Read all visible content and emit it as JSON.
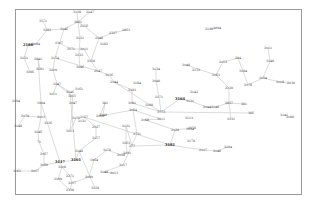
{
  "diagram": {
    "type": "network-graph",
    "frame": {
      "x": 15.5,
      "y": 9.5,
      "width": 286,
      "height": 185
    },
    "colors": {
      "frame": "#9a9a9a",
      "edge": "#c4c4c4",
      "label": "#333333"
    },
    "nodes": [
      {
        "id": "n1",
        "label": "3138",
        "x": 77,
        "y": 12
      },
      {
        "id": "n2",
        "label": "2147",
        "x": 90,
        "y": 12
      },
      {
        "id": "n3",
        "label": "3571",
        "x": 43,
        "y": 21
      },
      {
        "id": "n4",
        "label": "3821",
        "x": 78,
        "y": 22
      },
      {
        "id": "n5",
        "label": "2156",
        "x": 84,
        "y": 26
      },
      {
        "id": "n6",
        "label": "3182",
        "x": 47,
        "y": 30
      },
      {
        "id": "n7",
        "label": "3146",
        "x": 64,
        "y": 29
      },
      {
        "id": "n8",
        "label": "2327",
        "x": 113,
        "y": 33
      },
      {
        "id": "n9",
        "label": "1963",
        "x": 126,
        "y": 30
      },
      {
        "id": "n10",
        "label": "2131",
        "x": 80,
        "y": 38
      },
      {
        "id": "n11",
        "label": "2148",
        "x": 99,
        "y": 38
      },
      {
        "id": "n12",
        "label": "3182",
        "x": 104,
        "y": 44
      },
      {
        "id": "n13",
        "label": "2188",
        "x": 28,
        "y": 45,
        "bold": true
      },
      {
        "id": "n14",
        "label": "3084",
        "x": 36,
        "y": 44
      },
      {
        "id": "n15",
        "label": "2307",
        "x": 59,
        "y": 43
      },
      {
        "id": "n16",
        "label": "2571",
        "x": 71,
        "y": 49
      },
      {
        "id": "n17",
        "label": "3011",
        "x": 84,
        "y": 49
      },
      {
        "id": "n18",
        "label": "2133",
        "x": 79,
        "y": 55
      },
      {
        "id": "n19",
        "label": "2131",
        "x": 24,
        "y": 58
      },
      {
        "id": "n20",
        "label": "2841",
        "x": 38,
        "y": 59
      },
      {
        "id": "n21",
        "label": "2174",
        "x": 55,
        "y": 58
      },
      {
        "id": "n22",
        "label": "2138",
        "x": 91,
        "y": 61
      },
      {
        "id": "n23",
        "label": "3186",
        "x": 30,
        "y": 72
      },
      {
        "id": "n24",
        "label": "3181",
        "x": 40,
        "y": 69
      },
      {
        "id": "n25",
        "label": "2209",
        "x": 53,
        "y": 70
      },
      {
        "id": "n26",
        "label": "3046",
        "x": 80,
        "y": 67
      },
      {
        "id": "n27",
        "label": "2147",
        "x": 98,
        "y": 71
      },
      {
        "id": "n28",
        "label": "3136",
        "x": 109,
        "y": 75
      },
      {
        "id": "n29",
        "label": "2144",
        "x": 114,
        "y": 82
      },
      {
        "id": "n30",
        "label": "3184",
        "x": 137,
        "y": 83
      },
      {
        "id": "n31",
        "label": "3147",
        "x": 57,
        "y": 84
      },
      {
        "id": "n32",
        "label": "3011",
        "x": 53,
        "y": 94
      },
      {
        "id": "n33",
        "label": "3146",
        "x": 70,
        "y": 92
      },
      {
        "id": "n34",
        "label": "3165",
        "x": 72,
        "y": 96
      },
      {
        "id": "n35",
        "label": "2161",
        "x": 79,
        "y": 89
      },
      {
        "id": "n36",
        "label": "3183",
        "x": 132,
        "y": 90
      },
      {
        "id": "n37",
        "label": "2184",
        "x": 16,
        "y": 101
      },
      {
        "id": "n38",
        "label": "1994",
        "x": 41,
        "y": 103
      },
      {
        "id": "n39",
        "label": "2047",
        "x": 73,
        "y": 103
      },
      {
        "id": "n40",
        "label": "381",
        "x": 105,
        "y": 103
      },
      {
        "id": "n41",
        "label": "3081",
        "x": 132,
        "y": 103
      },
      {
        "id": "n42",
        "label": "3188",
        "x": 149,
        "y": 105
      },
      {
        "id": "n43",
        "label": "3773",
        "x": 161,
        "y": 112
      },
      {
        "id": "n44",
        "label": "3134",
        "x": 156,
        "y": 69
      },
      {
        "id": "n45",
        "label": "3048",
        "x": 156,
        "y": 81
      },
      {
        "id": "n46",
        "label": "2171",
        "x": 159,
        "y": 97
      },
      {
        "id": "n47",
        "label": "3164",
        "x": 180,
        "y": 99,
        "bold": true
      },
      {
        "id": "n48",
        "label": "3131",
        "x": 190,
        "y": 101
      },
      {
        "id": "n49",
        "label": "2143",
        "x": 194,
        "y": 92
      },
      {
        "id": "n50",
        "label": "2078",
        "x": 25,
        "y": 116
      },
      {
        "id": "n51",
        "label": "3148",
        "x": 18,
        "y": 126
      },
      {
        "id": "n52",
        "label": "2103",
        "x": 41,
        "y": 117
      },
      {
        "id": "n53",
        "label": "3126",
        "x": 48,
        "y": 123
      },
      {
        "id": "n54",
        "label": "3158",
        "x": 76,
        "y": 118
      },
      {
        "id": "n55",
        "label": "2157",
        "x": 84,
        "y": 117
      },
      {
        "id": "n56",
        "label": "2131",
        "x": 82,
        "y": 121
      },
      {
        "id": "n57",
        "label": "2008",
        "x": 100,
        "y": 116
      },
      {
        "id": "n58",
        "label": "2148",
        "x": 103,
        "y": 115
      },
      {
        "id": "n59",
        "label": "3064",
        "x": 133,
        "y": 110
      },
      {
        "id": "n60",
        "label": "3146",
        "x": 38,
        "y": 132
      },
      {
        "id": "n61",
        "label": "3113",
        "x": 70,
        "y": 131
      },
      {
        "id": "n62",
        "label": "2027",
        "x": 96,
        "y": 127
      },
      {
        "id": "n63",
        "label": "3157",
        "x": 96,
        "y": 138
      },
      {
        "id": "n64",
        "label": "2131",
        "x": 126,
        "y": 126
      },
      {
        "id": "n65",
        "label": "3731",
        "x": 137,
        "y": 134
      },
      {
        "id": "n66",
        "label": "2068",
        "x": 145,
        "y": 120
      },
      {
        "id": "n67",
        "label": "3111",
        "x": 161,
        "y": 119
      },
      {
        "id": "n68",
        "label": "3113",
        "x": 189,
        "y": 118
      },
      {
        "id": "n69",
        "label": "2158",
        "x": 192,
        "y": 128
      },
      {
        "id": "n70",
        "label": "2028",
        "x": 175,
        "y": 130
      },
      {
        "id": "n71",
        "label": "3134",
        "x": 190,
        "y": 129
      },
      {
        "id": "n72",
        "label": "71",
        "x": 39,
        "y": 142
      },
      {
        "id": "n73",
        "label": "3163",
        "x": 126,
        "y": 143
      },
      {
        "id": "n74",
        "label": "277",
        "x": 132,
        "y": 146
      },
      {
        "id": "n75",
        "label": "3181",
        "x": 170,
        "y": 145,
        "bold": true
      },
      {
        "id": "n76",
        "label": "2178",
        "x": 191,
        "y": 141
      },
      {
        "id": "n77",
        "label": "2067",
        "x": 44,
        "y": 154
      },
      {
        "id": "n78",
        "label": "2148",
        "x": 79,
        "y": 151
      },
      {
        "id": "n79",
        "label": "3178",
        "x": 107,
        "y": 150
      },
      {
        "id": "n80",
        "label": "2058",
        "x": 121,
        "y": 155
      },
      {
        "id": "n81",
        "label": "3191",
        "x": 127,
        "y": 153
      },
      {
        "id": "n82",
        "label": "2107",
        "x": 203,
        "y": 150
      },
      {
        "id": "n83",
        "label": "2048",
        "x": 217,
        "y": 151
      },
      {
        "id": "n84",
        "label": "3184",
        "x": 228,
        "y": 147
      },
      {
        "id": "n85",
        "label": "3117",
        "x": 60,
        "y": 162,
        "bold": true
      },
      {
        "id": "n86",
        "label": "3101",
        "x": 76,
        "y": 160,
        "bold": true
      },
      {
        "id": "n87",
        "label": "1964",
        "x": 94,
        "y": 160
      },
      {
        "id": "n88",
        "label": "3117",
        "x": 123,
        "y": 165
      },
      {
        "id": "n89",
        "label": "3061",
        "x": 17,
        "y": 171
      },
      {
        "id": "n90",
        "label": "2007",
        "x": 35,
        "y": 171
      },
      {
        "id": "n91",
        "label": "3069",
        "x": 44,
        "y": 165
      },
      {
        "id": "n92",
        "label": "3108",
        "x": 62,
        "y": 167
      },
      {
        "id": "n93",
        "label": "3148",
        "x": 104,
        "y": 172
      },
      {
        "id": "n94",
        "label": "2013",
        "x": 114,
        "y": 173
      },
      {
        "id": "n95",
        "label": "2199",
        "x": 58,
        "y": 179
      },
      {
        "id": "n96",
        "label": "2271",
        "x": 70,
        "y": 176
      },
      {
        "id": "n97",
        "label": "3157",
        "x": 72,
        "y": 183
      },
      {
        "id": "n98",
        "label": "2089",
        "x": 89,
        "y": 177
      },
      {
        "id": "n99",
        "label": "2338",
        "x": 70,
        "y": 190
      },
      {
        "id": "n100",
        "label": "3128",
        "x": 95,
        "y": 188
      },
      {
        "id": "n101",
        "label": "2138",
        "x": 209,
        "y": 29
      },
      {
        "id": "n102",
        "label": "3094",
        "x": 217,
        "y": 28
      },
      {
        "id": "n103",
        "label": "3011",
        "x": 268,
        "y": 48
      },
      {
        "id": "n104",
        "label": "3148",
        "x": 270,
        "y": 61
      },
      {
        "id": "n105",
        "label": "2053",
        "x": 223,
        "y": 62
      },
      {
        "id": "n106",
        "label": "384",
        "x": 238,
        "y": 58
      },
      {
        "id": "n107",
        "label": "3048",
        "x": 186,
        "y": 65
      },
      {
        "id": "n108",
        "label": "2133",
        "x": 196,
        "y": 70
      },
      {
        "id": "n109",
        "label": "2063",
        "x": 216,
        "y": 75
      },
      {
        "id": "n110",
        "label": "3184",
        "x": 243,
        "y": 71
      },
      {
        "id": "n111",
        "label": "3034",
        "x": 263,
        "y": 78
      },
      {
        "id": "n112",
        "label": "3008",
        "x": 280,
        "y": 82
      },
      {
        "id": "n113",
        "label": "2138",
        "x": 291,
        "y": 83
      },
      {
        "id": "n114",
        "label": "2078",
        "x": 248,
        "y": 85
      },
      {
        "id": "n115",
        "label": "2139",
        "x": 229,
        "y": 88
      },
      {
        "id": "n116",
        "label": "2837",
        "x": 229,
        "y": 103
      },
      {
        "id": "n117",
        "label": "381",
        "x": 244,
        "y": 104
      },
      {
        "id": "n118",
        "label": "2044",
        "x": 207,
        "y": 107
      },
      {
        "id": "n119",
        "label": "2148",
        "x": 215,
        "y": 107
      },
      {
        "id": "n120",
        "label": "2131",
        "x": 231,
        "y": 119
      },
      {
        "id": "n121",
        "label": "386",
        "x": 251,
        "y": 113
      },
      {
        "id": "n122",
        "label": "3141",
        "x": 284,
        "y": 115
      },
      {
        "id": "n123",
        "label": "2088",
        "x": 290,
        "y": 117
      }
    ],
    "edges": [
      [
        "n1",
        "n4"
      ],
      [
        "n2",
        "n4"
      ],
      [
        "n4",
        "n10"
      ],
      [
        "n4",
        "n5"
      ],
      [
        "n5",
        "n11"
      ],
      [
        "n7",
        "n4"
      ],
      [
        "n6",
        "n7"
      ],
      [
        "n6",
        "n3"
      ],
      [
        "n6",
        "n14"
      ],
      [
        "n14",
        "n13"
      ],
      [
        "n13",
        "n19"
      ],
      [
        "n19",
        "n23"
      ],
      [
        "n7",
        "n21"
      ],
      [
        "n21",
        "n25"
      ],
      [
        "n25",
        "n31"
      ],
      [
        "n10",
        "n18"
      ],
      [
        "n18",
        "n26"
      ],
      [
        "n11",
        "n22"
      ],
      [
        "n11",
        "n8"
      ],
      [
        "n8",
        "n9"
      ],
      [
        "n15",
        "n16"
      ],
      [
        "n16",
        "n17"
      ],
      [
        "n17",
        "n22"
      ],
      [
        "n22",
        "n27"
      ],
      [
        "n21",
        "n27"
      ],
      [
        "n27",
        "n28"
      ],
      [
        "n28",
        "n29"
      ],
      [
        "n29",
        "n36"
      ],
      [
        "n36",
        "n41"
      ],
      [
        "n41",
        "n43"
      ],
      [
        "n44",
        "n45"
      ],
      [
        "n45",
        "n46"
      ],
      [
        "n46",
        "n43"
      ],
      [
        "n29",
        "n43"
      ],
      [
        "n43",
        "n47"
      ],
      [
        "n47",
        "n48"
      ],
      [
        "n48",
        "n118"
      ],
      [
        "n118",
        "n119"
      ],
      [
        "n119",
        "n116"
      ],
      [
        "n116",
        "n115"
      ],
      [
        "n115",
        "n109"
      ],
      [
        "n109",
        "n105"
      ],
      [
        "n105",
        "n106"
      ],
      [
        "n106",
        "n110"
      ],
      [
        "n110",
        "n114"
      ],
      [
        "n114",
        "n111"
      ],
      [
        "n111",
        "n104"
      ],
      [
        "n104",
        "n103"
      ],
      [
        "n111",
        "n112"
      ],
      [
        "n112",
        "n113"
      ],
      [
        "n116",
        "n117"
      ],
      [
        "n116",
        "n120"
      ],
      [
        "n107",
        "n109"
      ],
      [
        "n43",
        "n121"
      ],
      [
        "n31",
        "n34"
      ],
      [
        "n34",
        "n39"
      ],
      [
        "n39",
        "n61"
      ],
      [
        "n61",
        "n54"
      ],
      [
        "n31",
        "n33"
      ],
      [
        "n33",
        "n86"
      ],
      [
        "n32",
        "n31"
      ],
      [
        "n24",
        "n20"
      ],
      [
        "n20",
        "n38"
      ],
      [
        "n38",
        "n52"
      ],
      [
        "n52",
        "n60"
      ],
      [
        "n60",
        "n72"
      ],
      [
        "n72",
        "n77"
      ],
      [
        "n77",
        "n91"
      ],
      [
        "n50",
        "n52"
      ],
      [
        "n50",
        "n51"
      ],
      [
        "n38",
        "n85"
      ],
      [
        "n85",
        "n91"
      ],
      [
        "n85",
        "n92"
      ],
      [
        "n92",
        "n95"
      ],
      [
        "n95",
        "n99"
      ],
      [
        "n92",
        "n96"
      ],
      [
        "n96",
        "n97"
      ],
      [
        "n97",
        "n99"
      ],
      [
        "n97",
        "n98"
      ],
      [
        "n98",
        "n87"
      ],
      [
        "n87",
        "n79"
      ],
      [
        "n79",
        "n80"
      ],
      [
        "n80",
        "n81"
      ],
      [
        "n81",
        "n73"
      ],
      [
        "n73",
        "n64"
      ],
      [
        "n64",
        "n74"
      ],
      [
        "n74",
        "n75"
      ],
      [
        "n75",
        "n70"
      ],
      [
        "n70",
        "n66"
      ],
      [
        "n66",
        "n67"
      ],
      [
        "n70",
        "n69"
      ],
      [
        "n75",
        "n82"
      ],
      [
        "n82",
        "n83"
      ],
      [
        "n83",
        "n84"
      ],
      [
        "n89",
        "n90"
      ],
      [
        "n90",
        "n91"
      ],
      [
        "n55",
        "n62"
      ],
      [
        "n62",
        "n63"
      ],
      [
        "n63",
        "n78"
      ],
      [
        "n78",
        "n100"
      ],
      [
        "n57",
        "n40"
      ],
      [
        "n57",
        "n59"
      ],
      [
        "n40",
        "n58"
      ],
      [
        "n59",
        "n67"
      ],
      [
        "n59",
        "n65"
      ],
      [
        "n65",
        "n88"
      ],
      [
        "n88",
        "n93"
      ],
      [
        "n93",
        "n94"
      ],
      [
        "n86",
        "n78"
      ],
      [
        "n85",
        "n86"
      ],
      [
        "n55",
        "n75"
      ],
      [
        "n101",
        "n102"
      ]
    ]
  }
}
